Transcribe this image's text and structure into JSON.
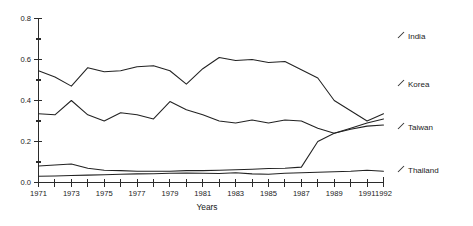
{
  "chart_data": {
    "type": "line",
    "title": "",
    "xlabel": "Years",
    "ylabel": "",
    "xlim": [
      1971,
      1992
    ],
    "ylim": [
      0.0,
      0.8
    ],
    "grid": false,
    "legend_position": "right",
    "x": [
      1971,
      1972,
      1973,
      1974,
      1975,
      1976,
      1977,
      1978,
      1979,
      1980,
      1981,
      1982,
      1983,
      1984,
      1985,
      1986,
      1987,
      1988,
      1989,
      1990,
      1991,
      1992
    ],
    "y_ticks": [
      0.0,
      0.2,
      0.4,
      0.6,
      0.8
    ],
    "y_tick_labels": [
      "0.0",
      "0.2",
      "0.4",
      "0.6",
      "0.8"
    ],
    "y_minor_ticks": [
      0.1,
      0.3,
      0.5,
      0.7
    ],
    "x_tick_labels": [
      "1971",
      "1973",
      "1975",
      "1977",
      "1979",
      "1981",
      "1983",
      "1985",
      "1987",
      "1989",
      "1991",
      "1992"
    ],
    "x_tick_label_years": [
      1971,
      1973,
      1975,
      1977,
      1979,
      1981,
      1983,
      1985,
      1987,
      1989,
      1991,
      1992
    ],
    "series": [
      {
        "name": "India",
        "values": [
          0.545,
          0.515,
          0.47,
          0.56,
          0.54,
          0.545,
          0.565,
          0.57,
          0.545,
          0.48,
          0.555,
          0.61,
          0.595,
          0.6,
          0.585,
          0.59,
          0.55,
          0.51,
          0.4,
          0.35,
          0.3,
          0.335
        ]
      },
      {
        "name": "Korea",
        "values": [
          0.335,
          0.33,
          0.4,
          0.33,
          0.3,
          0.34,
          0.33,
          0.31,
          0.395,
          0.355,
          0.33,
          0.3,
          0.29,
          0.305,
          0.29,
          0.305,
          0.3,
          0.265,
          0.24,
          0.26,
          0.275,
          0.28
        ]
      },
      {
        "name": "Taiwan",
        "values": [
          0.08,
          0.085,
          0.09,
          0.07,
          0.06,
          0.058,
          0.055,
          0.055,
          0.055,
          0.058,
          0.058,
          0.06,
          0.062,
          0.065,
          0.068,
          0.07,
          0.075,
          0.2,
          0.24,
          0.265,
          0.29,
          0.31
        ]
      },
      {
        "name": "Thailand",
        "values": [
          0.03,
          0.032,
          0.034,
          0.036,
          0.038,
          0.04,
          0.042,
          0.043,
          0.045,
          0.046,
          0.045,
          0.044,
          0.048,
          0.042,
          0.04,
          0.045,
          0.048,
          0.05,
          0.052,
          0.055,
          0.06,
          0.055
        ]
      }
    ],
    "legend_entries": [
      {
        "label": "India",
        "marker": "leader-tick"
      },
      {
        "label": "Korea",
        "marker": "leader-tick"
      },
      {
        "label": "Taiwan",
        "marker": "leader-tick"
      },
      {
        "label": "Thailand",
        "marker": "leader-tick"
      }
    ]
  },
  "legend": {
    "india": "India",
    "korea": "Korea",
    "taiwan": "Taiwan",
    "thailand": "Thailand"
  },
  "axes": {
    "x_title": "Years"
  }
}
